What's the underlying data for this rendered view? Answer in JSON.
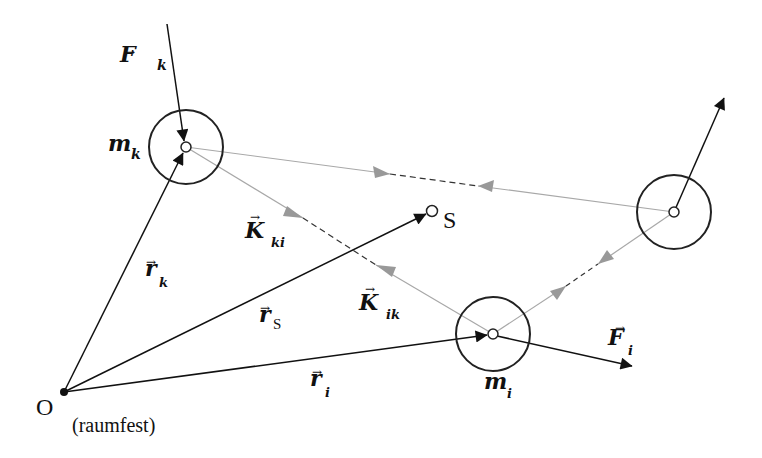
{
  "diagram": {
    "colors": {
      "primary": "#111111",
      "internal_force": "#a8a8a8",
      "background": "#ffffff"
    },
    "origin": {
      "label": "O",
      "note": "(raumfest)"
    },
    "center_of_mass": {
      "label": "S"
    },
    "masses": [
      {
        "id": "k",
        "label": "m",
        "sub": "k"
      },
      {
        "id": "i",
        "label": "m",
        "sub": "i"
      },
      {
        "id": "j",
        "label": "",
        "sub": ""
      }
    ],
    "vectors": {
      "r_k": {
        "label": "r",
        "sub": "k"
      },
      "r_s": {
        "label": "r",
        "sub": "S"
      },
      "r_i": {
        "label": "r",
        "sub": "i"
      },
      "F_k": {
        "label": "F",
        "sub": "k"
      },
      "F_i": {
        "label": "F",
        "sub": "i"
      },
      "K_ki": {
        "label": "K",
        "sub": "ki"
      },
      "K_ik": {
        "label": "K",
        "sub": "ik"
      }
    },
    "arrow_glyph": "→"
  }
}
